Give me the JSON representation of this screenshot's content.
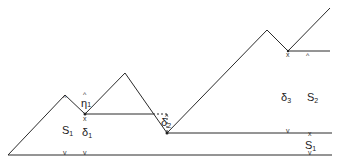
{
  "diagram": {
    "labels": [
      {
        "id": "s1-left",
        "base": "S",
        "sub": "1",
        "x": 62,
        "y": 134
      },
      {
        "id": "delta1",
        "base": "δ",
        "sub": "1",
        "x": 82,
        "y": 136
      },
      {
        "id": "eta1",
        "base": "η",
        "sub": "1",
        "x": 81,
        "y": 107
      },
      {
        "id": "delta2",
        "base": "δ",
        "sub": "2",
        "x": 161,
        "y": 126
      },
      {
        "id": "delta3",
        "base": "δ",
        "sub": "3",
        "x": 281,
        "y": 101
      },
      {
        "id": "s2",
        "base": "S",
        "sub": "2",
        "x": 307,
        "y": 101
      },
      {
        "id": "s1-right",
        "base": "S",
        "sub": "1",
        "x": 305,
        "y": 149
      }
    ],
    "markers": {
      "up": "^",
      "down": "v",
      "cross": "x"
    }
  }
}
